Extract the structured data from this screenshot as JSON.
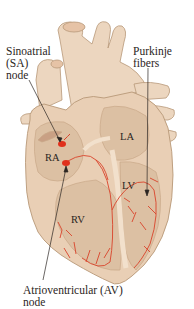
{
  "diagram": {
    "title_fragment": "",
    "labels": {
      "sa_node": [
        "Sinoatrial",
        "(SA)",
        "node"
      ],
      "purkinje": [
        "Purkinje",
        "fibers"
      ],
      "av_node": [
        "Atrioventricular (AV)",
        "node"
      ]
    },
    "chambers": {
      "ra": "RA",
      "la": "LA",
      "rv": "RV",
      "lv": "LV"
    },
    "colors": {
      "tissue": "#e9cfb5",
      "tissue_light": "#f2e0cc",
      "tissue_dark": "#d8b89a",
      "outline": "#b89878",
      "conduction": "#d9432a",
      "node": "#e0301c",
      "text": "#2b2522"
    }
  }
}
